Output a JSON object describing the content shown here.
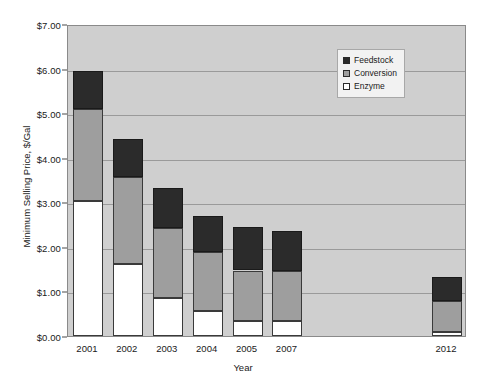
{
  "chart_data": {
    "type": "bar",
    "title": "",
    "subtitle": "",
    "xlabel": "Year",
    "ylabel": "Minimum Selling Price, $/Gal",
    "categories": [
      "2001",
      "2002",
      "2003",
      "2004",
      "2005",
      "2007",
      "2012"
    ],
    "ylim": [
      0,
      7
    ],
    "ytick_values": [
      0,
      1,
      2,
      3,
      4,
      5,
      6,
      7
    ],
    "ytick_labels": [
      "$0.00",
      "$1.00",
      "$2.00",
      "$3.00",
      "$4.00",
      "$5.00",
      "$6.00",
      "$7.00"
    ],
    "grid": true,
    "stacked": true,
    "legend_position": "top-right",
    "plot_background": "#cfcfcf",
    "series": [
      {
        "name": "Enzyme",
        "color": "#ffffff",
        "values": [
          3.02,
          1.61,
          0.86,
          0.56,
          0.34,
          0.34,
          0.09
        ]
      },
      {
        "name": "Conversion",
        "color": "#9e9e9e",
        "values": [
          2.08,
          1.95,
          1.56,
          1.32,
          1.13,
          1.12,
          0.7
        ]
      },
      {
        "name": "Feedstock",
        "color": "#2b2b2b",
        "values": [
          0.85,
          0.86,
          0.9,
          0.82,
          0.98,
          0.9,
          0.54
        ]
      }
    ],
    "totals": [
      5.95,
      4.42,
      3.32,
      2.7,
      2.45,
      2.36,
      1.33
    ],
    "segment_order_bottom_to_top": [
      "Enzyme",
      "Conversion",
      "Feedstock"
    ],
    "bar_slots": [
      0,
      1,
      2,
      3,
      4,
      5,
      9
    ],
    "slot_count": 10,
    "annotations": []
  },
  "legend": {
    "entries": [
      {
        "label": "Feedstock",
        "color": "#2b2b2b"
      },
      {
        "label": "Conversion",
        "color": "#9e9e9e"
      },
      {
        "label": "Enzyme",
        "color": "#ffffff"
      }
    ]
  }
}
